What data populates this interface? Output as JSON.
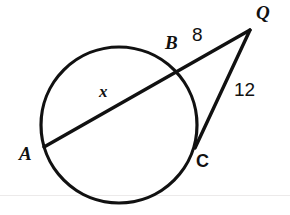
{
  "figure": {
    "type": "circle-secant-tangent-geometry-diagram",
    "width": 290,
    "height": 215,
    "background_color": "#ffffff",
    "stroke_color": "#111111",
    "baseline_rule_color": "#eceaea",
    "baseline_rule_y": 195
  },
  "circle": {
    "center_x": 119,
    "center_y": 125,
    "radius": 78,
    "stroke_width": 3.2
  },
  "points": {
    "A": {
      "label": "A",
      "x": 44,
      "y": 147,
      "label_x": 19,
      "label_y": 144,
      "style": "italic"
    },
    "B": {
      "label": "B",
      "x": 175,
      "y": 73,
      "label_x": 165,
      "label_y": 33,
      "style": "italic"
    },
    "C": {
      "label": "C",
      "x": 195,
      "y": 148,
      "label_x": 196,
      "label_y": 152,
      "style": "upright"
    },
    "Q": {
      "label": "Q",
      "x": 250,
      "y": 30,
      "label_x": 256,
      "label_y": 3,
      "style": "italic"
    }
  },
  "segments": {
    "secant": {
      "from": "A",
      "to": "Q",
      "through": "B",
      "stroke_width": 3.4
    },
    "tangent": {
      "from": "C",
      "to": "Q",
      "stroke_width": 3.4
    }
  },
  "measurements": [
    {
      "name": "x",
      "text": "x",
      "kind": "variable",
      "segment": "AB",
      "label_x": 99,
      "label_y": 83
    },
    {
      "name": "eight",
      "text": "8",
      "kind": "number",
      "value": 8,
      "segment": "BQ",
      "label_x": 192,
      "label_y": 25
    },
    {
      "name": "twelve",
      "text": "12",
      "kind": "number",
      "value": 12,
      "segment": "CQ",
      "label_x": 234,
      "label_y": 80
    }
  ]
}
